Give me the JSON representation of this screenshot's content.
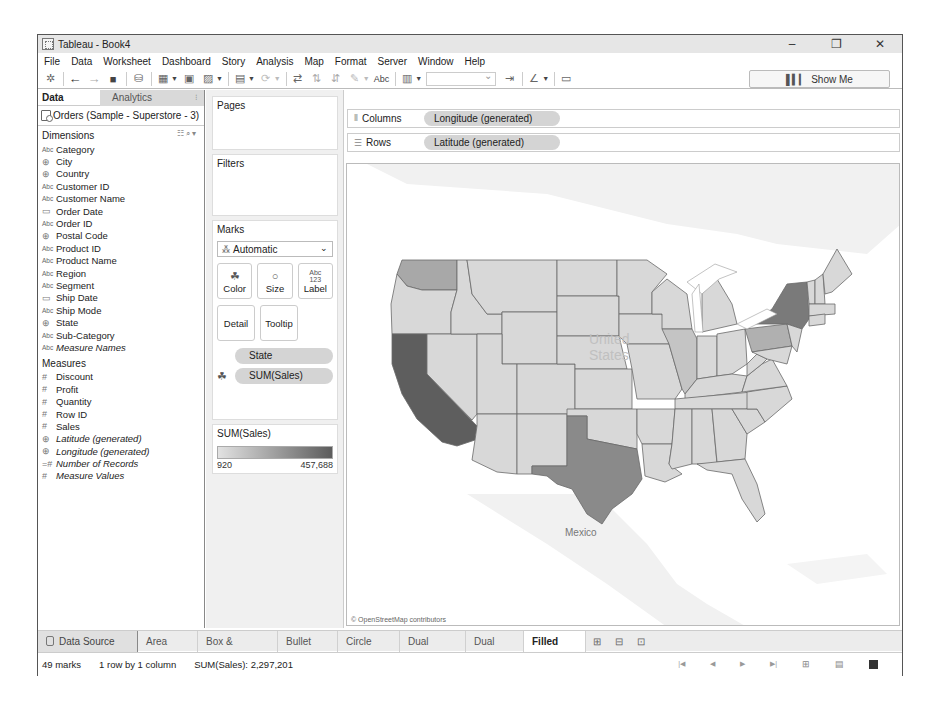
{
  "window": {
    "title": "Tableau - Book4",
    "controls": {
      "minimize": "–",
      "restore": "❐",
      "close": "✕"
    }
  },
  "menubar": {
    "items": [
      "File",
      "Data",
      "Worksheet",
      "Dashboard",
      "Story",
      "Analysis",
      "Map",
      "Format",
      "Server",
      "Window",
      "Help"
    ]
  },
  "toolbar": {
    "icons": [
      "tableau-logo-icon",
      "undo-icon",
      "redo-icon",
      "save-icon",
      "new-data-source-icon",
      "new-worksheet-icon",
      "duplicate-sheet-icon",
      "clear-sheet-icon",
      "automatic-updates-icon",
      "run-update-icon",
      "swap-icon",
      "sort-ascending-icon",
      "sort-descending-icon",
      "highlight-icon",
      "show-mark-labels-icon",
      "view-size-icon",
      "fit-dropdown",
      "fix-axes-icon",
      "tooltip-highlighter-icon",
      "presentation-mode-icon"
    ],
    "abc_label": "Abc",
    "fit_value": "",
    "show_me_label": "Show Me"
  },
  "data_pane": {
    "tabs": [
      {
        "label": "Data",
        "active": true
      },
      {
        "label": "Analytics",
        "active": false
      }
    ],
    "data_source": "Orders (Sample - Superstore - 3)",
    "dimensions_label": "Dimensions",
    "dimensions": [
      {
        "type": "Abc",
        "name": "Category",
        "italic": false
      },
      {
        "type": "globe",
        "name": "City",
        "italic": false
      },
      {
        "type": "globe",
        "name": "Country",
        "italic": false
      },
      {
        "type": "Abc",
        "name": "Customer ID",
        "italic": false
      },
      {
        "type": "Abc",
        "name": "Customer Name",
        "italic": false
      },
      {
        "type": "date",
        "name": "Order Date",
        "italic": false
      },
      {
        "type": "Abc",
        "name": "Order ID",
        "italic": false
      },
      {
        "type": "globe",
        "name": "Postal Code",
        "italic": false
      },
      {
        "type": "Abc",
        "name": "Product ID",
        "italic": false
      },
      {
        "type": "Abc",
        "name": "Product Name",
        "italic": false
      },
      {
        "type": "Abc",
        "name": "Region",
        "italic": false
      },
      {
        "type": "Abc",
        "name": "Segment",
        "italic": false
      },
      {
        "type": "date",
        "name": "Ship Date",
        "italic": false
      },
      {
        "type": "Abc",
        "name": "Ship Mode",
        "italic": false
      },
      {
        "type": "globe",
        "name": "State",
        "italic": false
      },
      {
        "type": "Abc",
        "name": "Sub-Category",
        "italic": false
      },
      {
        "type": "Abc",
        "name": "Measure Names",
        "italic": true
      }
    ],
    "measures_label": "Measures",
    "measures": [
      {
        "type": "#",
        "name": "Discount",
        "italic": false
      },
      {
        "type": "#",
        "name": "Profit",
        "italic": false
      },
      {
        "type": "#",
        "name": "Quantity",
        "italic": false
      },
      {
        "type": "#",
        "name": "Row ID",
        "italic": false
      },
      {
        "type": "#",
        "name": "Sales",
        "italic": false
      },
      {
        "type": "globe",
        "name": "Latitude (generated)",
        "italic": true
      },
      {
        "type": "globe",
        "name": "Longitude (generated)",
        "italic": true
      },
      {
        "type": "=#",
        "name": "Number of Records",
        "italic": true
      },
      {
        "type": "#",
        "name": "Measure Values",
        "italic": true
      }
    ]
  },
  "shelves": {
    "pages_label": "Pages",
    "filters_label": "Filters",
    "marks_label": "Marks",
    "mark_type": "Automatic",
    "mark_buttons": {
      "color": "Color",
      "size": "Size",
      "label": "Label",
      "detail": "Detail",
      "tooltip": "Tooltip"
    },
    "mark_pills": [
      {
        "label": "State",
        "encoding": "detail"
      },
      {
        "label": "SUM(Sales)",
        "encoding": "color"
      }
    ],
    "legend": {
      "title": "SUM(Sales)",
      "min": "920",
      "max": "457,688",
      "color_low": "#e2e2e2",
      "color_high": "#5c5c5c"
    }
  },
  "columns_shelf": {
    "label": "Columns",
    "pill": "Longitude (generated)"
  },
  "rows_shelf": {
    "label": "Rows",
    "pill": "Latitude (generated)"
  },
  "map": {
    "labels": {
      "country": "United States",
      "mexico": "Mexico"
    },
    "credit": "© OpenStreetMap contributors",
    "highlighted_states": {
      "California": "#5e5e5e",
      "Texas": "#8a8a8a",
      "New York": "#7a7a7a",
      "Washington": "#a8a8a8",
      "Pennsylvania": "#b0b0b0",
      "default": "#d8d8d8"
    }
  },
  "sheet_tabs": {
    "data_source": "Data Source",
    "tabs": [
      "Area",
      "Box & whisker",
      "Bullet",
      "Circle",
      "Dual combo",
      "Dual lines",
      "Filled map"
    ],
    "active": "Filled map"
  },
  "statusbar": {
    "marks": "49 marks",
    "dims": "1 row by 1 column",
    "sum": "SUM(Sales): 2,297,201"
  }
}
